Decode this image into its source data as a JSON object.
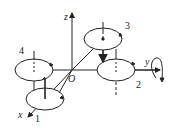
{
  "diagram": {
    "type": "quadrotor-coordinate-frame",
    "axes": {
      "x": "x",
      "y": "y",
      "z": "z",
      "origin": "O"
    },
    "rotors": [
      {
        "id": "1",
        "label": "1"
      },
      {
        "id": "2",
        "label": "2"
      },
      {
        "id": "3",
        "label": "3"
      },
      {
        "id": "4",
        "label": "4"
      }
    ],
    "colors": {
      "stroke": "#222222",
      "background": "#ffffff"
    }
  }
}
